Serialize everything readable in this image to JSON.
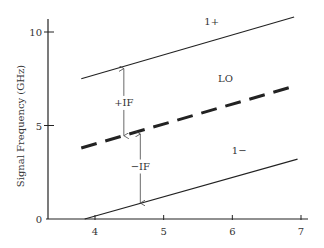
{
  "chart_data": {
    "type": "line",
    "title": "",
    "xlabel": "",
    "ylabel": "Signal Frequency (GHz)",
    "xlim": [
      3.3,
      7.1
    ],
    "ylim": [
      0,
      10.7
    ],
    "xticks": [
      4,
      5,
      6,
      7
    ],
    "yticks": [
      0,
      5,
      10
    ],
    "xtick_labels": [
      "4",
      "5",
      "6",
      "7"
    ],
    "ytick_labels": [
      "0",
      "5",
      "10"
    ],
    "grid": false,
    "legend": "none",
    "series": [
      {
        "name": "1+",
        "style": "solid",
        "x": [
          3.8,
          6.9
        ],
        "y": [
          7.5,
          10.8
        ],
        "label_at": [
          5.7,
          10.4
        ]
      },
      {
        "name": "LO",
        "style": "dashed",
        "x": [
          3.8,
          6.9
        ],
        "y": [
          3.8,
          7.1
        ],
        "label_at": [
          5.9,
          7.3
        ]
      },
      {
        "name": "1−",
        "style": "solid",
        "x": [
          3.85,
          6.95
        ],
        "y": [
          0,
          3.2
        ],
        "label_at": [
          6.1,
          3.5
        ]
      }
    ],
    "annotations": [
      {
        "text": "+IF",
        "x": 4.42,
        "from": 8.1,
        "to": 4.4,
        "label_y": 6.1
      },
      {
        "text": "−IF",
        "x": 4.66,
        "from": 4.6,
        "to": 0.8,
        "label_y": 2.7
      }
    ]
  }
}
